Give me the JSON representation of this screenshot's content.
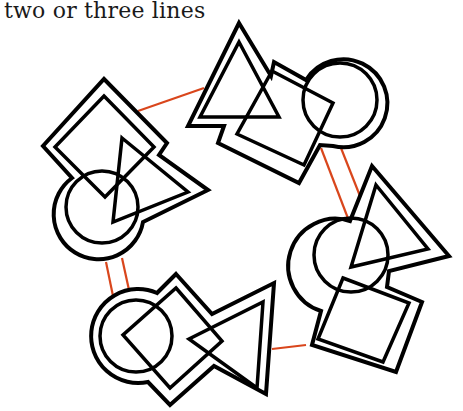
{
  "caption": "two or three lines",
  "colors": {
    "shape_stroke": "#000000",
    "link_stroke": "#d9461c",
    "background": "#ffffff"
  },
  "diagram": {
    "clusters": [
      {
        "id": "top",
        "shapes": [
          "triangle",
          "square",
          "circle"
        ]
      },
      {
        "id": "left",
        "shapes": [
          "square",
          "triangle",
          "circle"
        ]
      },
      {
        "id": "right",
        "shapes": [
          "triangle",
          "circle",
          "square"
        ]
      },
      {
        "id": "bottom-left",
        "shapes": [
          "circle",
          "square",
          "triangle"
        ]
      },
      {
        "id": "bottom-right",
        "shapes": [
          "square"
        ]
      }
    ],
    "links": [
      {
        "from": "left",
        "to": "top",
        "lines": 1
      },
      {
        "from": "top",
        "to": "right",
        "lines": 2
      },
      {
        "from": "left",
        "to": "bottom-left",
        "lines": 2
      },
      {
        "from": "bottom-left",
        "to": "right",
        "lines": 1
      }
    ]
  }
}
